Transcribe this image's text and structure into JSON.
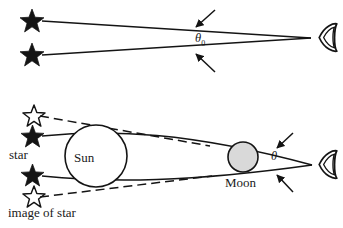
{
  "figure": {
    "background_color": "#ffffff",
    "ink_color": "#141414",
    "moon_fill_color": "#d9d9d9",
    "sun_fill_color": "#ffffff",
    "panels": [
      {
        "name": "undeflected-starlight",
        "description": "Two stars send straight rays to the observer's eye, subtending angle theta-naught",
        "angle_label": "θ",
        "angle_subscript": "0",
        "observer_icon": "eye-icon",
        "star_count": 2,
        "star_style": "filled"
      },
      {
        "name": "deflected-starlight",
        "description": "Rays bend around the Sun during a solar eclipse; apparent star images are displaced outward, subtending angle theta",
        "angle_label": "θ",
        "observer_icon": "eye-icon",
        "bodies": [
          {
            "name": "Sun",
            "label": "Sun",
            "style": "hollow-circle"
          },
          {
            "name": "Moon",
            "label": "Moon",
            "style": "gray-circle"
          }
        ],
        "star_count": 2,
        "star_style": "filled",
        "image_star_count": 2,
        "image_star_style": "hollow"
      }
    ],
    "labels": {
      "star": "star",
      "image_of_star": "image of star",
      "sun": "Sun",
      "moon": "Moon",
      "theta_zero": "θ",
      "theta_zero_sub": "0",
      "theta": "θ"
    }
  }
}
